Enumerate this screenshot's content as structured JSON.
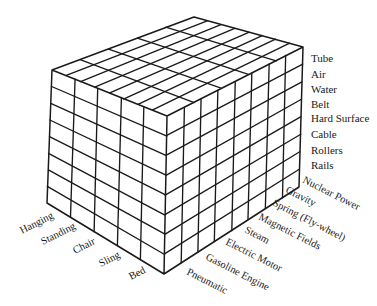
{
  "diagram": {
    "type": "morphological-box",
    "colors": {
      "ink": "#1a1a1a",
      "background": "#ffffff"
    },
    "geometry": {
      "top_back": [
        194,
        17
      ],
      "top_left": [
        52,
        70
      ],
      "top_front": [
        167,
        116
      ],
      "top_right": [
        303,
        47
      ],
      "bottom_left": [
        47,
        203
      ],
      "bottom_front": [
        164,
        274
      ],
      "bottom_right": [
        299,
        187
      ]
    },
    "axes": {
      "vertical": {
        "labels": [
          "Tube",
          "Air",
          "Water",
          "Belt",
          "Hard Surface",
          "Cable",
          "Rollers",
          "Rails"
        ]
      },
      "right_depth": {
        "labels": [
          "Pneumatic",
          "Gasoline Engine",
          "Electric Motor",
          "Steam",
          "Magnetic Fields",
          "Spring (Fly-wheel)",
          "Gravity",
          "Nuclear Power"
        ]
      },
      "left_depth": {
        "labels": [
          "Hanging",
          "Standing",
          "Chair",
          "Sling",
          "Bed"
        ]
      }
    }
  }
}
